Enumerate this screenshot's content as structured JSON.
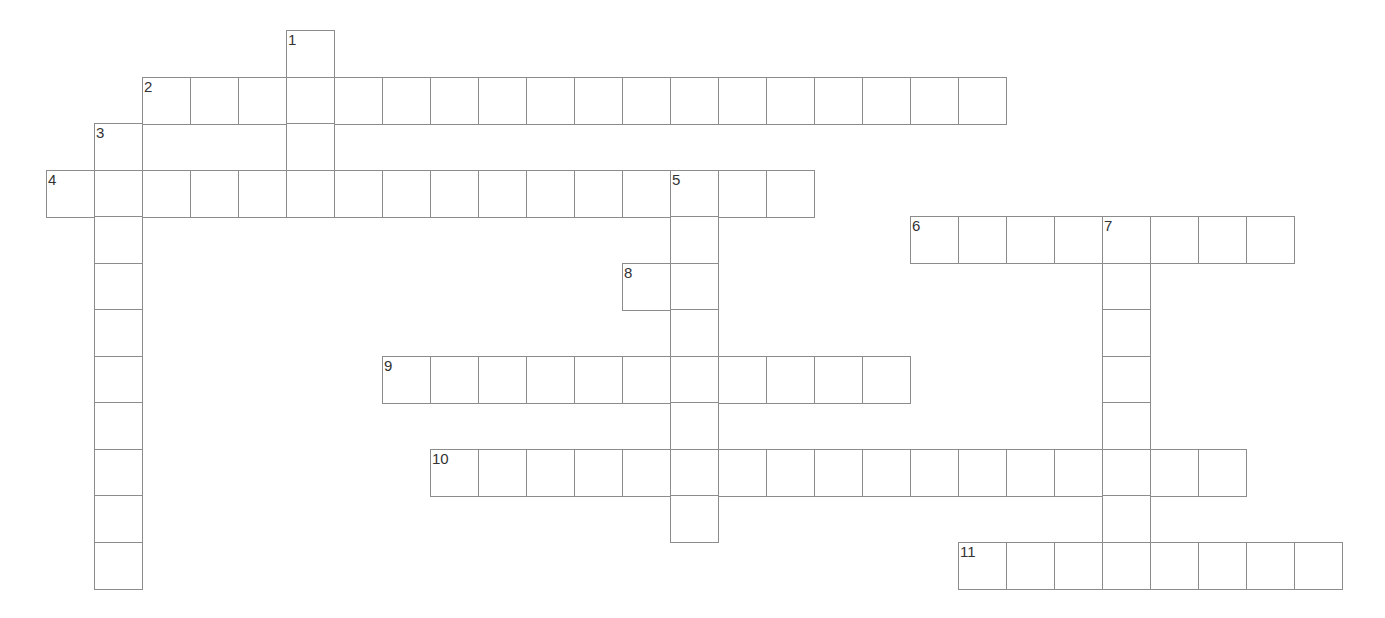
{
  "puzzle": {
    "type": "crossword",
    "cell_size_px": 48,
    "origin": {
      "x": 46,
      "y": 30
    },
    "row_step_px": 46.5,
    "colors": {
      "border": "#8c8c8c",
      "number": "#333333",
      "background": "#ffffff"
    },
    "entries": [
      {
        "number": "1",
        "direction": "down",
        "col": 5,
        "row": 0,
        "length": 4
      },
      {
        "number": "2",
        "direction": "across",
        "col": 2,
        "row": 1,
        "length": 18
      },
      {
        "number": "3",
        "direction": "down",
        "col": 1,
        "row": 2,
        "length": 10
      },
      {
        "number": "4",
        "direction": "across",
        "col": 0,
        "row": 3,
        "length": 16
      },
      {
        "number": "5",
        "direction": "down",
        "col": 13,
        "row": 3,
        "length": 8
      },
      {
        "number": "6",
        "direction": "across",
        "col": 18,
        "row": 4,
        "length": 8
      },
      {
        "number": "7",
        "direction": "down",
        "col": 22,
        "row": 4,
        "length": 8
      },
      {
        "number": "8",
        "direction": "across",
        "col": 12,
        "row": 5,
        "length": 2
      },
      {
        "number": "9",
        "direction": "across",
        "col": 7,
        "row": 7,
        "length": 11
      },
      {
        "number": "10",
        "direction": "across",
        "col": 8,
        "row": 9,
        "length": 17
      },
      {
        "number": "11",
        "direction": "across",
        "col": 19,
        "row": 11,
        "length": 8
      }
    ]
  }
}
